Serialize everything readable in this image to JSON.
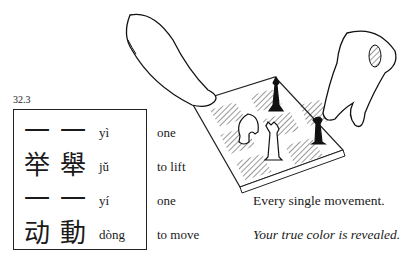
{
  "section": {
    "number": "32.3"
  },
  "vocab": [
    {
      "simplified": "一",
      "traditional": "一",
      "pinyin": "yì",
      "gloss": "one"
    },
    {
      "simplified": "举",
      "traditional": "舉",
      "pinyin": "jŭ",
      "gloss": "to lift"
    },
    {
      "simplified": "一",
      "traditional": "一",
      "pinyin": "yí",
      "gloss": "one"
    },
    {
      "simplified": "动",
      "traditional": "動",
      "pinyin": "dòng",
      "gloss": "to move"
    }
  ],
  "translation": {
    "literal": "Every single movement.",
    "figurative": "Your true color is revealed."
  },
  "illustration": {
    "subject": "two hands moving chess pieces on a chessboard"
  }
}
